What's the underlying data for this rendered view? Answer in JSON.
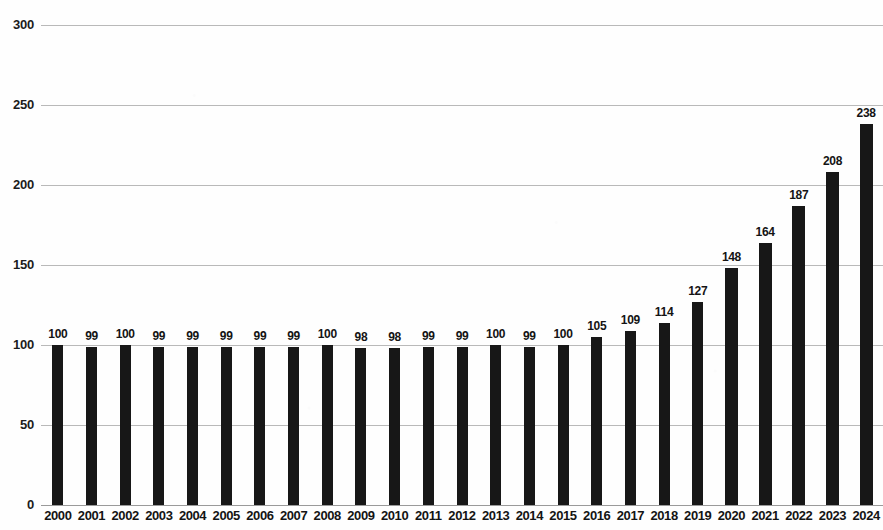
{
  "chart_data": {
    "type": "bar",
    "title": "",
    "subtitle": "",
    "xlabel": "",
    "ylabel": "",
    "ylim": [
      0,
      300
    ],
    "ytick_interval": 50,
    "ytick_labels": [
      "300",
      "250",
      "200",
      "150",
      "100",
      "50",
      "0"
    ],
    "ytick_values": [
      300,
      250,
      200,
      150,
      100,
      50,
      0
    ],
    "grid": true,
    "legend": "none",
    "bar_color": "#171717",
    "gridline_color": "#b9b9b9",
    "background_color": "#fefefe",
    "show_value_labels": true,
    "categories": [
      "2000",
      "2001",
      "2002",
      "2003",
      "2004",
      "2005",
      "2006",
      "2007",
      "2008",
      "2009",
      "2010",
      "2011",
      "2012",
      "2013",
      "2014",
      "2015",
      "2016",
      "2017",
      "2018",
      "2019",
      "2020",
      "2021",
      "2022",
      "2023",
      "2024"
    ],
    "values": [
      100,
      99,
      100,
      99,
      99,
      99,
      99,
      99,
      100,
      98,
      98,
      99,
      99,
      100,
      99,
      100,
      105,
      109,
      114,
      127,
      148,
      164,
      187,
      208,
      238
    ],
    "value_labels": [
      "100",
      "99",
      "100",
      "99",
      "99",
      "99",
      "99",
      "99",
      "100",
      "98",
      "98",
      "99",
      "99",
      "100",
      "99",
      "100",
      "105",
      "109",
      "114",
      "127",
      "148",
      "164",
      "187",
      "208",
      "238"
    ]
  }
}
